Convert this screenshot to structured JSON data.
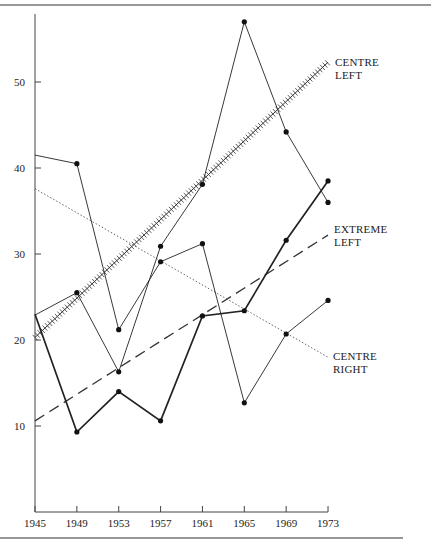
{
  "chart_data": {
    "type": "line",
    "title": "",
    "xlabel": "",
    "ylabel": "",
    "x": [
      1945,
      1949,
      1953,
      1957,
      1961,
      1965,
      1969,
      1973
    ],
    "xticks": [
      "1945",
      "1949",
      "1953",
      "1957",
      "1961",
      "1965",
      "1969",
      "1973"
    ],
    "yticks": [
      "10",
      "20",
      "30",
      "40",
      "50"
    ],
    "ylim": [
      0,
      58
    ],
    "xlim": [
      1945,
      1973
    ],
    "grid": false,
    "legend_position": "inline-right",
    "series": [
      {
        "name": "Centre Left",
        "style": "thin-solid",
        "values": [
          22.9,
          25.5,
          16.3,
          30.9,
          38.1,
          57.0,
          44.2,
          36.0
        ]
      },
      {
        "name": "Extreme Left",
        "style": "thick-solid",
        "values": [
          23.0,
          9.3,
          14.0,
          10.6,
          22.8,
          23.4,
          31.6,
          38.5
        ]
      },
      {
        "name": "Centre Right",
        "style": "thin-solid",
        "values": [
          41.5,
          40.5,
          21.2,
          29.1,
          31.2,
          12.7,
          20.7,
          24.6
        ]
      }
    ],
    "trend_lines": [
      {
        "name": "Centre Left",
        "style": "hatched",
        "start": [
          1945,
          20.3
        ],
        "end": [
          1973,
          52.3
        ]
      },
      {
        "name": "Extreme Left",
        "style": "dashed",
        "start": [
          1945,
          10.6
        ],
        "end": [
          1973,
          32.2
        ]
      },
      {
        "name": "Centre Right",
        "style": "dotted",
        "start": [
          1945,
          37.6
        ],
        "end": [
          1973,
          18.0
        ]
      }
    ],
    "annotations": [
      {
        "text": [
          "CENTRE",
          "LEFT"
        ],
        "near": "Centre Left trend end"
      },
      {
        "text": [
          "EXTREME",
          "LEFT"
        ],
        "near": "Extreme Left trend end"
      },
      {
        "text": [
          "CENTRE",
          "RIGHT"
        ],
        "near": "Centre Right trend end"
      }
    ]
  },
  "labels": {
    "centre_left_1": "CENTRE",
    "centre_left_2": "LEFT",
    "extreme_left_1": "EXTREME",
    "extreme_left_2": "LEFT",
    "centre_right_1": "CENTRE",
    "centre_right_2": "RIGHT"
  }
}
